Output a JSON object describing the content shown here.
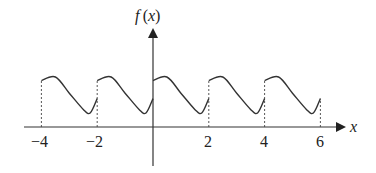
{
  "chart_data": {
    "type": "line",
    "title": "",
    "xlabel": "x",
    "ylabel": "f(x)",
    "x_ticks": [
      -4,
      -2,
      2,
      4,
      6
    ],
    "x_tick_labels": [
      "−4",
      "−2",
      "2",
      "4",
      "6"
    ],
    "period": 2,
    "domain": [
      -4,
      6
    ],
    "one_period_shape": {
      "x": [
        0,
        0.5,
        1.0,
        1.5,
        1.75,
        2.0
      ],
      "y_relative": [
        0.9,
        1.0,
        0.55,
        0.1,
        0.0,
        0.4
      ]
    },
    "dashed_lines_at": [
      -4,
      -2,
      2,
      4,
      6
    ],
    "grid": false,
    "legend": false
  },
  "labels": {
    "y_axis": "f (x)",
    "x_axis": "x",
    "ticks": [
      "−4",
      "−2",
      "2",
      "4",
      "6"
    ]
  }
}
